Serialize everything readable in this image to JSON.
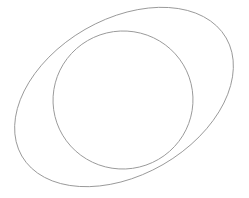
{
  "canvas": {
    "width": 249,
    "height": 198,
    "background_color": "#ffffff",
    "description": "Line drawing of two overlapping unfilled ellipses on a plain white background"
  },
  "chart_data": {
    "type": "scatter",
    "title": "",
    "subtitle": "",
    "xlabel": "",
    "ylabel": "",
    "grid": false,
    "legend_position": "none",
    "axis_visible": false,
    "tick_labels_visible": false,
    "annotations": [],
    "shape_count": 2,
    "shapes": [
      {
        "name": "outer-ellipse",
        "kind": "ellipse",
        "center_x": 124,
        "center_y": 97,
        "radius_x": 118,
        "radius_y": 78,
        "rotation_deg": -30,
        "stroke_color": "#9a9a9a",
        "stroke_width": 1,
        "fill": "none",
        "bbox_left": 10,
        "bbox_top": 11,
        "bbox_right": 237,
        "bbox_bottom": 183
      },
      {
        "name": "inner-circle",
        "kind": "ellipse",
        "center_x": 123,
        "center_y": 100,
        "radius_x": 70,
        "radius_y": 69,
        "rotation_deg": -8,
        "stroke_color": "#9a9a9a",
        "stroke_width": 1,
        "fill": "none",
        "bbox_left": 53,
        "bbox_top": 31,
        "bbox_right": 192,
        "bbox_bottom": 169
      }
    ],
    "colors": {
      "stroke": "#9a9a9a",
      "background": "#ffffff"
    }
  }
}
